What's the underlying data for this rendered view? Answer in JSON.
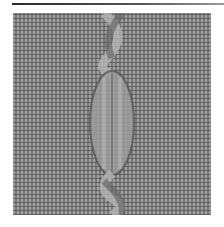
{
  "image": {
    "subject": "knitted cable swatch",
    "description": "Gray knitted fabric in reverse stockinette with a single vertical twisted cable running down the center; a dark horizontal rule sits above the swatch.",
    "colors": {
      "background": "#ffffff",
      "fabric": "#8a8a8a",
      "cable_highlight": "#b5b5b5",
      "cable_shadow": "#555555",
      "rule": "#2a2a2a"
    }
  }
}
